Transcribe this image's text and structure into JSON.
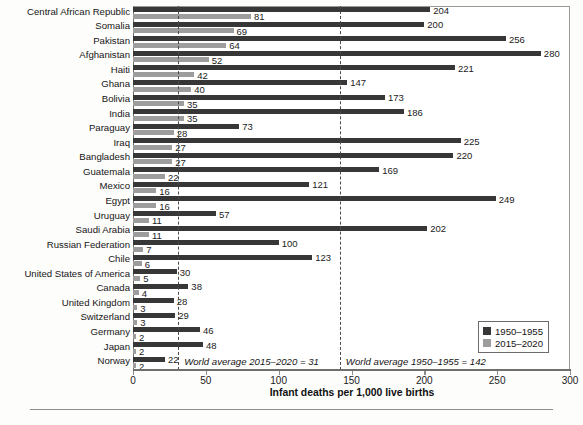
{
  "chart_data": {
    "type": "bar",
    "orientation": "horizontal",
    "title": "",
    "xlabel": "Infant deaths per 1,000 live births",
    "ylabel": "",
    "xlim": [
      0,
      300
    ],
    "xticks": [
      0,
      50,
      100,
      150,
      200,
      250,
      300
    ],
    "grid": false,
    "legend_position": "bottom-right",
    "categories": [
      "Central African Republic",
      "Somalia",
      "Pakistan",
      "Afghanistan",
      "Haiti",
      "Ghana",
      "Bolivia",
      "India",
      "Paraguay",
      "Iraq",
      "Bangladesh",
      "Guatemala",
      "Mexico",
      "Egypt",
      "Uruguay",
      "Saudi Arabia",
      "Russian Federation",
      "Chile",
      "United States of America",
      "Canada",
      "United Kingdom",
      "Switzerland",
      "Germany",
      "Japan",
      "Norway"
    ],
    "series": [
      {
        "name": "1950–1955",
        "color": "#373737",
        "values": [
          204,
          200,
          256,
          280,
          221,
          147,
          173,
          186,
          73,
          225,
          220,
          169,
          121,
          249,
          57,
          202,
          100,
          123,
          30,
          38,
          28,
          29,
          46,
          48,
          22
        ]
      },
      {
        "name": "2015–2020",
        "color": "#9d9d9d",
        "values": [
          81,
          69,
          64,
          52,
          42,
          40,
          35,
          35,
          28,
          27,
          27,
          22,
          16,
          16,
          11,
          11,
          7,
          6,
          5,
          4,
          3,
          3,
          2,
          2,
          2
        ]
      }
    ],
    "annotations": [
      {
        "text": "World average 2015–2020 = 31",
        "value": 31
      },
      {
        "text": "World average 1950–1955 = 142",
        "value": 142
      }
    ],
    "reference_lines": [
      {
        "value": 31,
        "style": "dashed"
      },
      {
        "value": 142,
        "style": "dashed"
      }
    ]
  },
  "legend": {
    "items": [
      {
        "label": "1950–1955",
        "swatch": "dark"
      },
      {
        "label": "2015–2020",
        "swatch": "light"
      }
    ]
  },
  "footer": {
    "caption": ""
  }
}
